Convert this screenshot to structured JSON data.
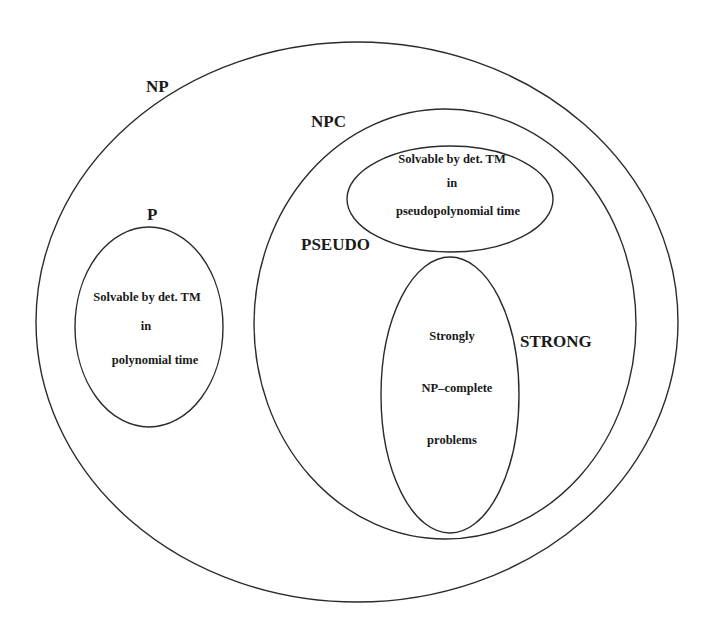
{
  "diagram": {
    "colors": {
      "background": "#ffffff",
      "stroke": "#2b2b2b",
      "text": "#1a1a1a"
    },
    "sets": {
      "np": {
        "label": "NP"
      },
      "npc": {
        "label": "NPC"
      },
      "p": {
        "label": "P",
        "lines": [
          "Solvable by det. TM",
          "in",
          "polynomial time"
        ]
      },
      "pseudo": {
        "label": "PSEUDO",
        "lines": [
          "Solvable by det. TM",
          "in",
          "pseudopolynomial time"
        ]
      },
      "strong": {
        "label": "STRONG",
        "lines": [
          "Strongly",
          "NP–complete",
          "problems"
        ]
      }
    }
  }
}
